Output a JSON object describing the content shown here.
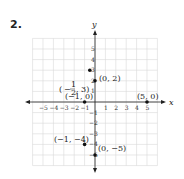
{
  "problem_number": "2.",
  "chart_data": {
    "type": "scatter",
    "title": "",
    "xlabel": "x",
    "ylabel": "y",
    "xlim": [
      -6,
      6
    ],
    "ylim": [
      -6,
      6
    ],
    "grid": true,
    "x_ticks": [
      -5,
      -4,
      -3,
      -2,
      -1,
      1,
      2,
      3,
      4,
      5
    ],
    "y_ticks": [
      -5,
      -4,
      -3,
      -2,
      -1,
      1,
      2,
      3,
      4,
      5
    ],
    "points": [
      {
        "x": -0.5,
        "y": 3,
        "label": "(−½, 3)"
      },
      {
        "x": 0,
        "y": 2,
        "label": "(0, 2)"
      },
      {
        "x": -1,
        "y": 0,
        "label": "(−1, 0)"
      },
      {
        "x": 5,
        "y": 0,
        "label": "(5, 0)"
      },
      {
        "x": -1,
        "y": -4,
        "label": "(−1, −4)"
      },
      {
        "x": 0,
        "y": -5,
        "label": "(0, −5)"
      }
    ]
  },
  "labels": {
    "x_axis": "x",
    "y_axis": "y",
    "p1": "(0, 2)",
    "p2": "(−1, 0)",
    "p3": "(5, 0)",
    "p4": "(−1, −4)",
    "p5": "(0, −5)",
    "p0_close": ", 3)",
    "frac_num": "1",
    "frac_den": "2"
  }
}
